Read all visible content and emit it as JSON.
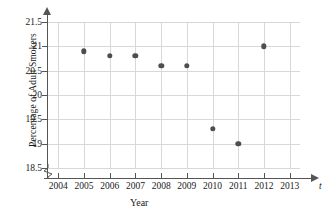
{
  "chart_data": {
    "type": "scatter",
    "title": "",
    "xlabel": "Year",
    "ylabel": "Percentage of Adult Smokers",
    "x_variable_symbol": "t",
    "x": [
      2005,
      2006,
      2007,
      2008,
      2009,
      2010,
      2011,
      2012
    ],
    "values": [
      20.9,
      20.8,
      20.8,
      20.6,
      20.6,
      19.3,
      19.0,
      21.0
    ],
    "series": [
      {
        "name": "Percentage of Adult Smokers",
        "points": [
          {
            "x": 2005,
            "y": 20.9
          },
          {
            "x": 2006,
            "y": 20.8
          },
          {
            "x": 2007,
            "y": 20.8
          },
          {
            "x": 2008,
            "y": 20.6
          },
          {
            "x": 2009,
            "y": 20.6
          },
          {
            "x": 2010,
            "y": 19.3
          },
          {
            "x": 2011,
            "y": 19.0
          },
          {
            "x": 2012,
            "y": 21.0
          }
        ]
      }
    ],
    "x_ticks": [
      2004,
      2005,
      2006,
      2007,
      2008,
      2009,
      2010,
      2011,
      2012,
      2013
    ],
    "x_tick_labels": [
      "2004",
      "2005",
      "2006",
      "2007",
      "2008",
      "2009",
      "2010",
      "2011",
      "2012",
      "2013"
    ],
    "y_ticks": [
      18.5,
      19,
      19.5,
      20,
      20.5,
      21,
      21.5
    ],
    "y_tick_labels": [
      "18.5",
      "19",
      "19.5",
      "20",
      "20.5",
      "21",
      "21.5"
    ],
    "xlim": [
      2003.6,
      2013.4
    ],
    "ylim": [
      18.5,
      21.5
    ],
    "grid": true,
    "legend": null,
    "legend_position": "none",
    "has_axis_break": true,
    "marker_color": "#4d4d52",
    "grid_color": "#d8d8dc",
    "axis_color": "#555555",
    "background_color": "#ffffff"
  }
}
